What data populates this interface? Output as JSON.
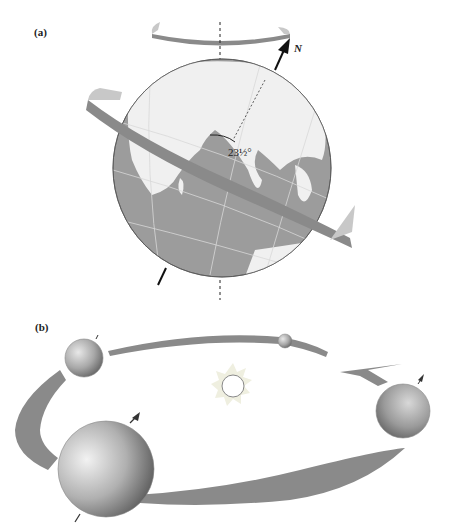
{
  "figure": {
    "panels": [
      {
        "id": "a",
        "label": "(a)",
        "description": "Earth with rotation axis tilted relative to vertical; ecliptic ring around globe; rotation arrow at top",
        "axis_label": "N",
        "tilt_angle_label": "23½°"
      },
      {
        "id": "b",
        "label": "(b)",
        "description": "Earth at four positions in its orbit around the Sun, axis maintaining constant tilt; arrow shows orbital direction"
      }
    ],
    "colors": {
      "band": "#8a8a8a",
      "band_light": "#c8c8c8",
      "ocean": "#9c9c9c",
      "land": "#f2f2f2",
      "sun_rays": "#eeeedd",
      "axis": "#111111"
    }
  }
}
